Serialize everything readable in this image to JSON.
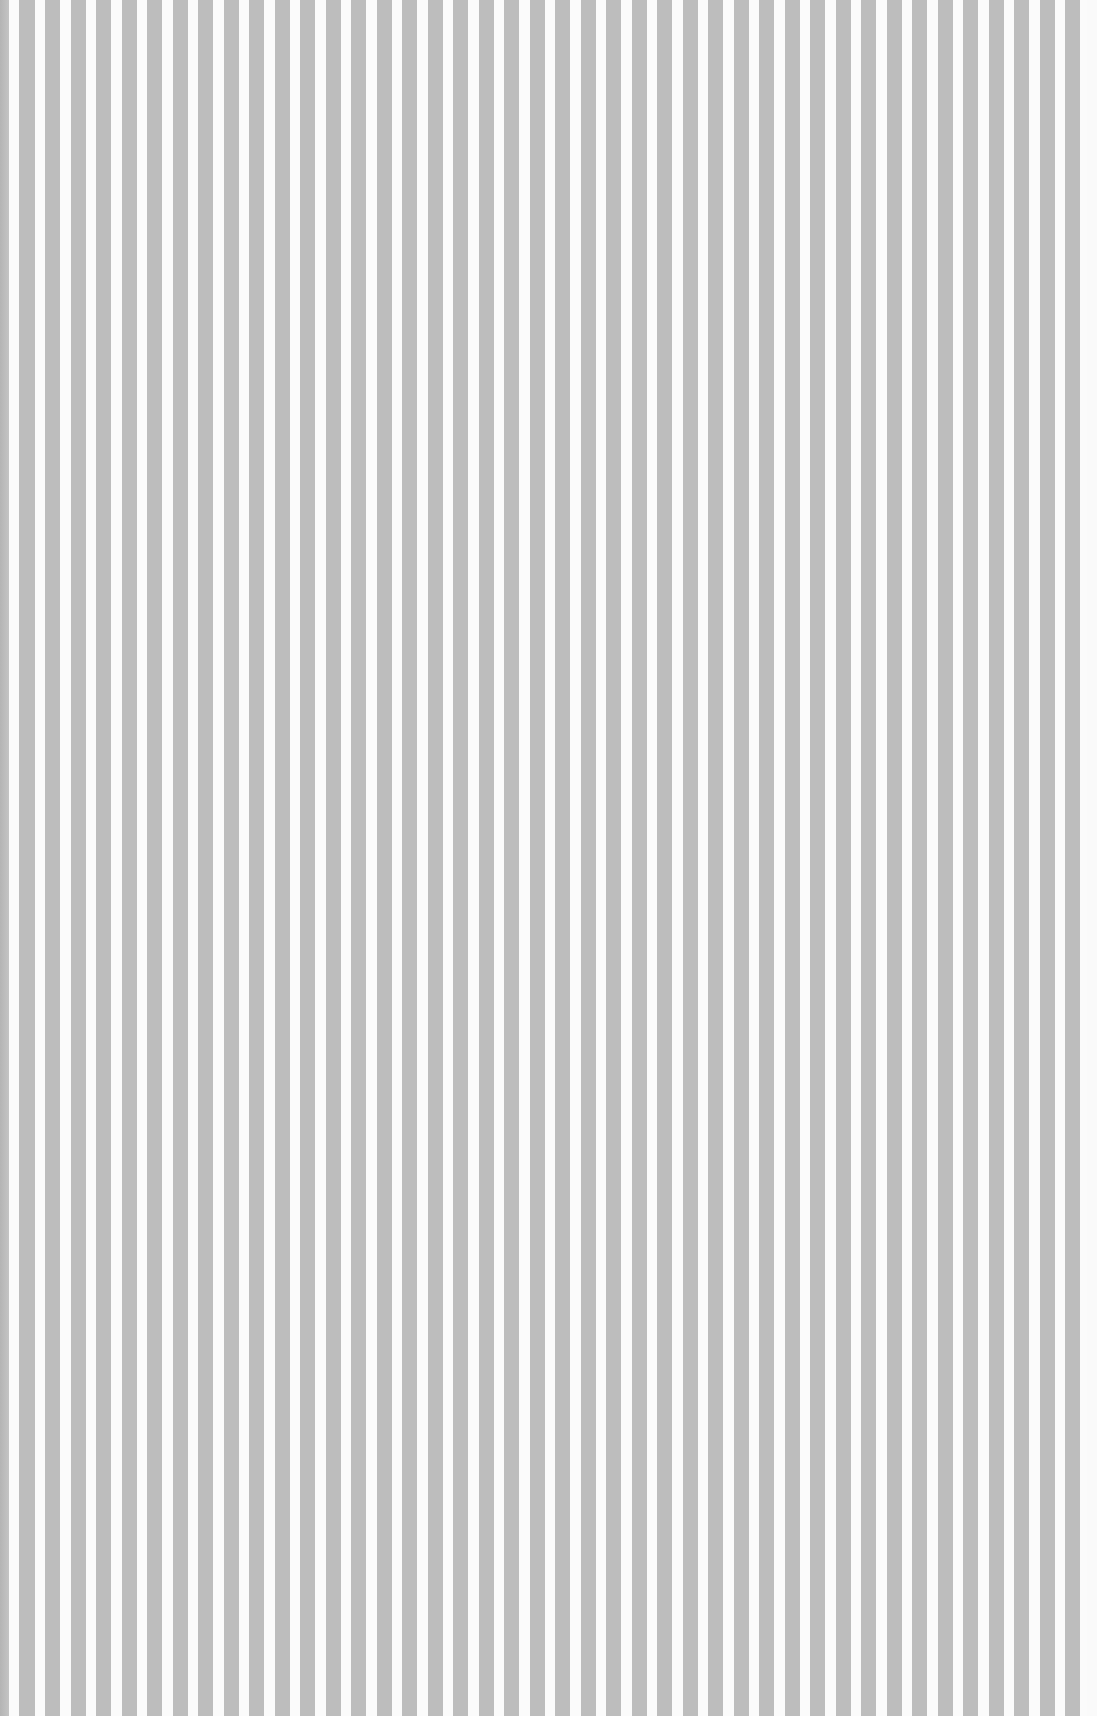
{
  "image": {
    "description": "Vertical gray and white pinstripe texture",
    "colors": {
      "stripe": "#bdbdbd",
      "background": "#fbfbfb",
      "edge": "#b8b8b8"
    },
    "stripe_period_px": 25.5,
    "stripe_width_px": 15
  }
}
